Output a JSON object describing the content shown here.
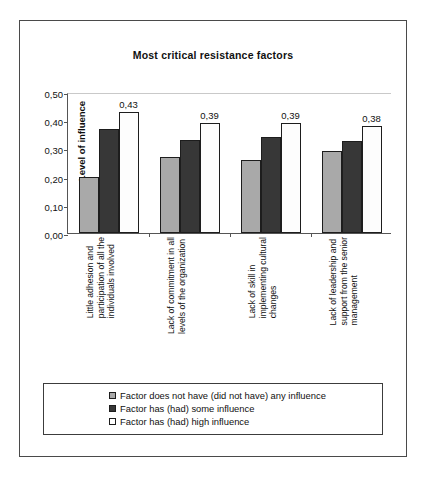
{
  "chart_data": {
    "type": "bar",
    "title": "Most critical resistance factors",
    "xlabel": "",
    "ylabel": "Level of influence",
    "ylim": [
      0.0,
      0.5
    ],
    "ytick_step": 0.1,
    "ytick_labels": [
      "0,50",
      "0,40",
      "0,30",
      "0,20",
      "0,10",
      "0,00"
    ],
    "ytick_values": [
      0.5,
      0.4,
      0.3,
      0.2,
      0.1,
      0.0
    ],
    "decimal_separator": ",",
    "grid": false,
    "legend_position": "bottom",
    "categories": [
      "Little adhesion and participation of all the individuals involved",
      "Lack of commitment in all levels of the organization",
      "Lack of skill in implementing cultural changes",
      "Lack of leadership and support from the senior management"
    ],
    "category_label_lines": [
      [
        "Little adhesion and",
        "participation of all the",
        "individuals involved"
      ],
      [
        "Lack of commitment in all",
        "levels of the organization"
      ],
      [
        "Lack of skill in",
        "implementing cultural",
        "changes"
      ],
      [
        "Lack of leadership and",
        "support from the senior",
        "management"
      ]
    ],
    "series": [
      {
        "name": "Factor does not have (did not have) any influence",
        "color": "#a9a9a9",
        "values": [
          0.2,
          0.27,
          0.26,
          0.29
        ],
        "data_labels": [
          "",
          "",
          "",
          ""
        ]
      },
      {
        "name": "Factor  has (had) some influence",
        "color": "#373737",
        "values": [
          0.37,
          0.33,
          0.34,
          0.325
        ],
        "data_labels": [
          "",
          "",
          "",
          ""
        ]
      },
      {
        "name": "Factor has (had) high influence",
        "color": "#ffffff",
        "values": [
          0.43,
          0.39,
          0.39,
          0.38
        ],
        "data_labels": [
          "0,43",
          "0,39",
          "0,39",
          "0,38"
        ]
      }
    ]
  },
  "legend": {
    "items": [
      {
        "label": "Factor does not have (did not have) any influence"
      },
      {
        "label": "Factor  has (had) some influence"
      },
      {
        "label": "Factor has (had) high influence"
      }
    ]
  }
}
